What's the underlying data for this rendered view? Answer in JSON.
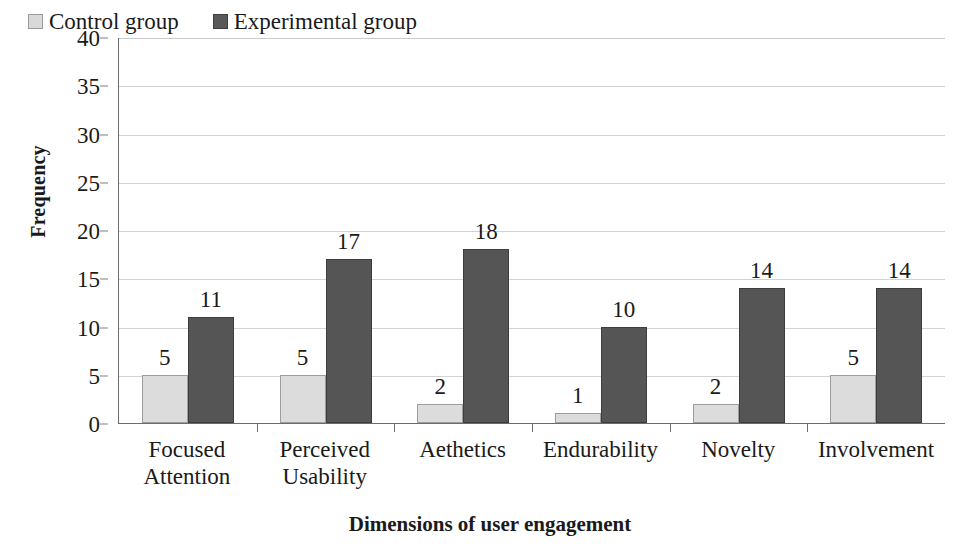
{
  "chart_data": {
    "type": "bar",
    "title": "",
    "xlabel": "Dimensions of user engagement",
    "ylabel": "Frequency",
    "categories": [
      "Focused Attention",
      "Perceived Usability",
      "Aethetics",
      "Endurability",
      "Novelty",
      "Involvement"
    ],
    "category_lines": [
      [
        "Focused",
        "Attention"
      ],
      [
        "Perceived",
        "Usability"
      ],
      [
        "Aethetics"
      ],
      [
        "Endurability"
      ],
      [
        "Novelty"
      ],
      [
        "Involvement"
      ]
    ],
    "series": [
      {
        "name": "Control group",
        "color": "#dcdcdc",
        "values": [
          5,
          5,
          2,
          1,
          2,
          5
        ]
      },
      {
        "name": "Experimental group",
        "color": "#555555",
        "values": [
          11,
          17,
          18,
          10,
          14,
          14
        ]
      }
    ],
    "ylim": [
      0,
      40
    ],
    "ytick_step": 5,
    "yticks": [
      40,
      35,
      30,
      25,
      20,
      15,
      10,
      5,
      0
    ],
    "grid": true,
    "grid_axis": "y",
    "legend_position": "top-left-inside",
    "data_labels": true
  },
  "legend": {
    "items": [
      {
        "label": "Control group",
        "swatch": "control"
      },
      {
        "label": "Experimental group",
        "swatch": "experimental"
      }
    ]
  },
  "colors": {
    "control_fill": "#dcdcdc",
    "control_border": "#9e9e9e",
    "experimental_fill": "#555555",
    "experimental_border": "#3d3d3d",
    "axis": "#6b6b6b",
    "grid": "#d2d2d2",
    "text": "#1a1a1a",
    "background": "#ffffff"
  }
}
